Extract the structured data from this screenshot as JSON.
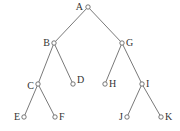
{
  "diagram": {
    "type": "binary-tree",
    "root": "A",
    "nodes": [
      "A",
      "B",
      "G",
      "C",
      "D",
      "H",
      "I",
      "E",
      "F",
      "J",
      "K"
    ],
    "edges": [
      [
        "A",
        "B"
      ],
      [
        "A",
        "G"
      ],
      [
        "B",
        "C"
      ],
      [
        "B",
        "D"
      ],
      [
        "G",
        "H"
      ],
      [
        "G",
        "I"
      ],
      [
        "C",
        "E"
      ],
      [
        "C",
        "F"
      ],
      [
        "I",
        "J"
      ],
      [
        "I",
        "K"
      ]
    ],
    "labels": {
      "A": "A",
      "B": "B",
      "G": "G",
      "C": "C",
      "D": "D",
      "H": "H",
      "I": "I",
      "E": "E",
      "F": "F",
      "J": "J",
      "K": "K"
    }
  }
}
